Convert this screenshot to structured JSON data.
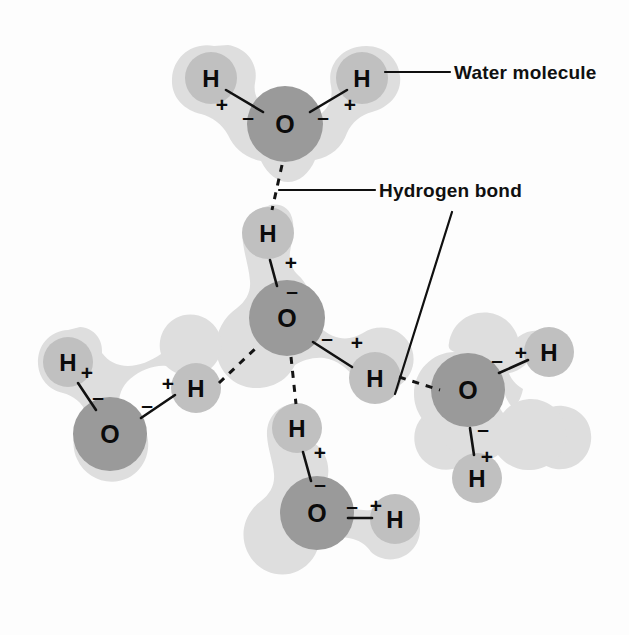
{
  "figure": {
    "background_color": "#fdfdfd"
  },
  "colors": {
    "halo": "#dedede",
    "oxygen_atom": "#9a9a9a",
    "hydrogen_atom": "#c0c0c0",
    "ink": "#101010"
  },
  "labels": [
    {
      "id": "water-molecule",
      "text": "Water molecule"
    },
    {
      "id": "hydrogen-bond",
      "text": "Hydrogen bond"
    }
  ],
  "atom_symbols": {
    "oxygen": "O",
    "hydrogen": "H"
  },
  "charges": {
    "negative": "–",
    "positive": "+"
  },
  "molecules": [
    {
      "id": "molecule-top",
      "name": "top water molecule",
      "oxygen": {
        "symbol": "O"
      },
      "hydrogens": [
        {
          "symbol": "H",
          "position": "upper-left",
          "charge": "+"
        },
        {
          "symbol": "H",
          "position": "upper-right",
          "charge": "+"
        }
      ],
      "oxygen_charges": [
        "–",
        "–"
      ]
    },
    {
      "id": "molecule-center",
      "name": "central water molecule",
      "oxygen": {
        "symbol": "O"
      },
      "hydrogens": [
        {
          "symbol": "H",
          "position": "top",
          "charge": "+"
        },
        {
          "symbol": "H",
          "position": "lower-right",
          "charge": "+"
        }
      ],
      "oxygen_charges": [
        "–",
        "–"
      ]
    },
    {
      "id": "molecule-left",
      "name": "left water molecule",
      "oxygen": {
        "symbol": "O"
      },
      "hydrogens": [
        {
          "symbol": "H",
          "position": "upper-left",
          "charge": "+"
        },
        {
          "symbol": "H",
          "position": "right",
          "charge": "+"
        }
      ],
      "oxygen_charges": [
        "–",
        "–"
      ]
    },
    {
      "id": "molecule-right",
      "name": "right water molecule",
      "oxygen": {
        "symbol": "O"
      },
      "hydrogens": [
        {
          "symbol": "H",
          "position": "upper-right",
          "charge": "+"
        },
        {
          "symbol": "H",
          "position": "below",
          "charge": "+"
        }
      ],
      "oxygen_charges": [
        "–",
        "–"
      ]
    },
    {
      "id": "molecule-bottom",
      "name": "bottom water molecule",
      "oxygen": {
        "symbol": "O"
      },
      "hydrogens": [
        {
          "symbol": "H",
          "position": "top",
          "charge": "+"
        },
        {
          "symbol": "H",
          "position": "right",
          "charge": "+"
        }
      ],
      "oxygen_charges": [
        "–",
        "–"
      ]
    }
  ],
  "hydrogen_bonds": [
    {
      "id": "hbond-top-center",
      "from": "molecule-top oxygen",
      "to": "molecule-center top hydrogen"
    },
    {
      "id": "hbond-left-center",
      "from": "molecule-left right hydrogen",
      "to": "molecule-center oxygen"
    },
    {
      "id": "hbond-center-right",
      "from": "molecule-center lower-right hydrogen",
      "to": "molecule-right oxygen"
    },
    {
      "id": "hbond-center-bottom",
      "from": "molecule-center oxygen",
      "to": "molecule-bottom top hydrogen"
    }
  ]
}
